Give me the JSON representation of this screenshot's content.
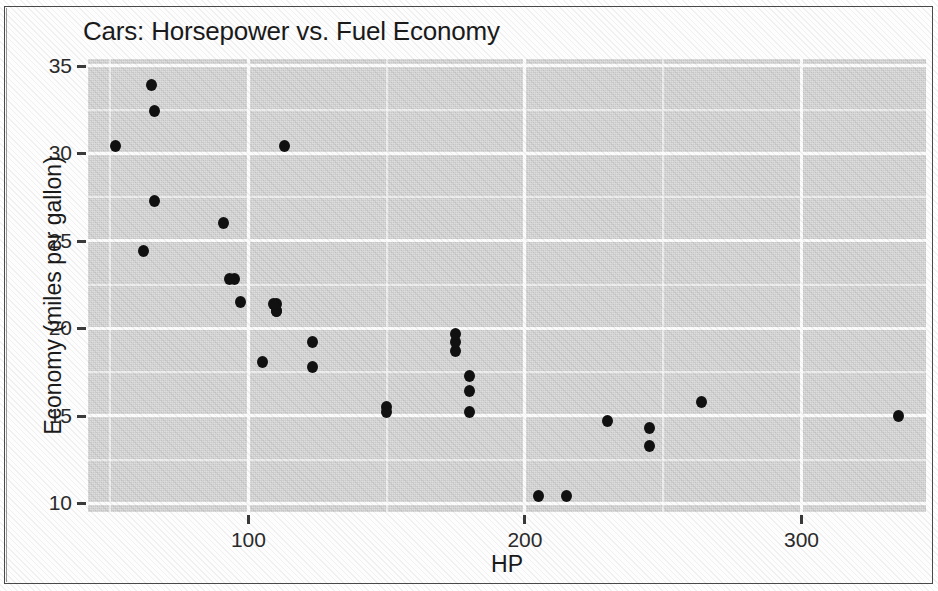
{
  "chart_data": {
    "type": "scatter",
    "title": "Cars: Horsepower vs. Fuel Economy",
    "xlabel": "HP",
    "ylabel": "Economy (miles per gallon)",
    "xlim": [
      42,
      345
    ],
    "ylim": [
      9.5,
      35.4
    ],
    "xticks": [
      100,
      200,
      300
    ],
    "xtick_labels": [
      "100",
      "200",
      "300"
    ],
    "yticks": [
      10,
      15,
      20,
      25,
      30,
      35
    ],
    "ytick_labels": [
      "10",
      "15",
      "20",
      "25",
      "30",
      "35"
    ],
    "x_minor_ticks": [
      50,
      150,
      250,
      300
    ],
    "y_minor_ticks": [
      12.5,
      17.5,
      22.5,
      27.5,
      32.5
    ],
    "grid": true,
    "legend": null,
    "point_color": "#111111",
    "panel_color": "#d9d9d9",
    "grid_color": "#fbfbfb",
    "series": [
      {
        "name": "cars",
        "x": [
          110,
          110,
          93,
          110,
          175,
          105,
          245,
          62,
          95,
          123,
          123,
          180,
          180,
          180,
          205,
          215,
          230,
          66,
          52,
          65,
          97,
          150,
          150,
          245,
          175,
          66,
          91,
          113,
          264,
          175,
          335,
          109
        ],
        "y": [
          21.0,
          21.0,
          22.8,
          21.4,
          18.7,
          18.1,
          14.3,
          24.4,
          22.8,
          19.2,
          17.8,
          16.4,
          17.3,
          15.2,
          10.4,
          10.4,
          14.7,
          32.4,
          30.4,
          33.9,
          21.5,
          15.5,
          15.2,
          13.3,
          19.2,
          27.3,
          26.0,
          30.4,
          15.8,
          19.7,
          15.0,
          21.4
        ]
      }
    ]
  }
}
